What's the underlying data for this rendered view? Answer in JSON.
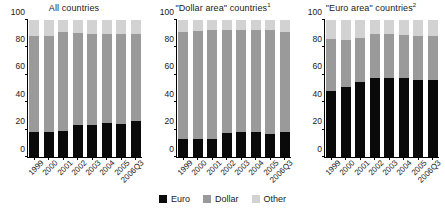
{
  "chart_data": {
    "type": "bar",
    "subtype": "stacked-percentage",
    "title": "",
    "categories": [
      "1999",
      "2000",
      "2001",
      "2002",
      "2003",
      "2004",
      "2005",
      "2006Q3"
    ],
    "ylim": [
      0,
      100
    ],
    "yticks": [
      0,
      20,
      40,
      60,
      80,
      100
    ],
    "ylabel": "",
    "xlabel": "",
    "grid": false,
    "legend_position": "bottom-center",
    "legend": [
      "Euro",
      "Dollar",
      "Other"
    ],
    "colors": {
      "euro": "#0a0a0a",
      "dollar": "#9a9a9a",
      "other": "#d2d2d2",
      "axis": "#000000",
      "background": "#ffffff"
    },
    "panels": [
      {
        "id": "all-countries",
        "title": "All countries",
        "title_sup": "",
        "series": [
          {
            "name": "Euro",
            "values": [
              18,
              18,
              19,
              23.5,
              23.5,
              24.5,
              24,
              26
            ]
          },
          {
            "name": "Dollar",
            "values": [
              70,
              70,
              72,
              67,
              66.5,
              65.5,
              66,
              64
            ]
          },
          {
            "name": "Other",
            "values": [
              12,
              12,
              9,
              9.5,
              10,
              10,
              10,
              10
            ]
          }
        ]
      },
      {
        "id": "dollar-area-countries",
        "title": "\"Dollar area\" countries",
        "title_sup": "1",
        "series": [
          {
            "name": "Euro",
            "values": [
              13,
              13,
              13.5,
              17.5,
              18,
              18,
              16.5,
              18
            ]
          },
          {
            "name": "Dollar",
            "values": [
              78,
              79,
              79,
              75.5,
              75,
              75,
              76,
              73.5
            ]
          },
          {
            "name": "Other",
            "values": [
              9,
              8,
              7.5,
              7,
              7,
              7,
              7.5,
              8.5
            ]
          }
        ]
      },
      {
        "id": "euro-area-countries",
        "title": "\"Euro area\" countries",
        "title_sup": "2",
        "series": [
          {
            "name": "Euro",
            "values": [
              48,
              51,
              55,
              58,
              58,
              57.5,
              56,
              56.5
            ]
          },
          {
            "name": "Dollar",
            "values": [
              38.5,
              34.5,
              32,
              32,
              32,
              31.5,
              32.5,
              32
            ]
          },
          {
            "name": "Other",
            "values": [
              13.5,
              14.5,
              13,
              10,
              10,
              11,
              11.5,
              11.5
            ]
          }
        ]
      }
    ]
  }
}
